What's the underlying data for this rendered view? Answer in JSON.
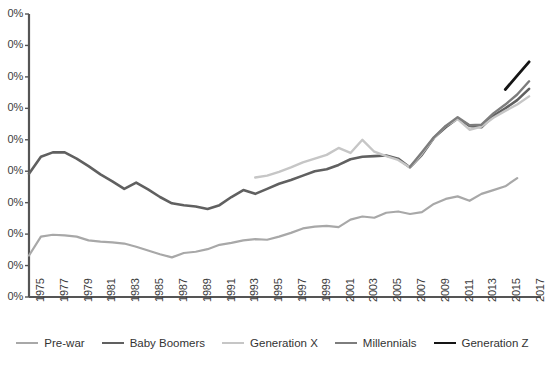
{
  "chart_data": {
    "type": "line",
    "title": "",
    "subtitle": "",
    "xlabel": "",
    "ylabel": "",
    "grid": false,
    "legend_position": "bottom",
    "xlim": [
      1975,
      2018
    ],
    "ylim": [
      0,
      45
    ],
    "yticks": [
      "0%",
      "0%",
      "0%",
      "0%",
      "0%",
      "0%",
      "0%",
      "0%",
      "0%",
      "0%"
    ],
    "ytick_values": [
      45,
      40,
      35,
      30,
      25,
      20,
      15,
      10,
      5,
      0
    ],
    "xticks": [
      "1975",
      "1977",
      "1979",
      "1981",
      "1983",
      "1985",
      "1987",
      "1989",
      "1991",
      "1993",
      "1995",
      "1997",
      "1999",
      "2001",
      "2003",
      "2005",
      "2007",
      "2009",
      "2011",
      "2013",
      "2015",
      "2017"
    ],
    "x": [
      1975,
      1976,
      1977,
      1978,
      1979,
      1980,
      1981,
      1982,
      1983,
      1984,
      1985,
      1986,
      1987,
      1988,
      1989,
      1990,
      1991,
      1992,
      1993,
      1994,
      1995,
      1996,
      1997,
      1998,
      1999,
      2000,
      2001,
      2002,
      2003,
      2004,
      2005,
      2006,
      2007,
      2008,
      2009,
      2010,
      2011,
      2012,
      2013,
      2014,
      2015,
      2016,
      2017,
      2018
    ],
    "series": [
      {
        "name": "Pre-war",
        "color": "#a8a8a8",
        "width": 2.2,
        "x": [
          1975,
          1976,
          1977,
          1978,
          1979,
          1980,
          1981,
          1982,
          1983,
          1984,
          1985,
          1986,
          1987,
          1988,
          1989,
          1990,
          1991,
          1992,
          1993,
          1994,
          1995,
          1996,
          1997,
          1998,
          1999,
          2000,
          2001,
          2002,
          2003,
          2004,
          2005,
          2006,
          2007,
          2008,
          2009,
          2010,
          2011,
          2012,
          2013,
          2014,
          2015,
          2016
        ],
        "values": [
          6.6,
          9.6,
          9.9,
          9.8,
          9.6,
          9.0,
          8.8,
          8.7,
          8.5,
          8.0,
          7.4,
          6.8,
          6.3,
          7.0,
          7.2,
          7.6,
          8.3,
          8.6,
          9.0,
          9.2,
          9.1,
          9.6,
          10.2,
          10.9,
          11.2,
          11.3,
          11.1,
          12.3,
          12.8,
          12.6,
          13.4,
          13.6,
          13.2,
          13.5,
          14.8,
          15.6,
          16.0,
          15.3,
          16.4,
          17.0,
          17.6,
          18.9
        ]
      },
      {
        "name": "Baby Boomers",
        "color": "#606060",
        "width": 2.6,
        "x": [
          1975,
          1976,
          1977,
          1978,
          1979,
          1980,
          1981,
          1982,
          1983,
          1984,
          1985,
          1986,
          1987,
          1988,
          1989,
          1990,
          1991,
          1992,
          1993,
          1994,
          1995,
          1996,
          1997,
          1998,
          1999,
          2000,
          2001,
          2002,
          2003,
          2004,
          2005,
          2006,
          2007,
          2008,
          2009,
          2010,
          2011,
          2012,
          2013,
          2014,
          2015,
          2016,
          2017
        ],
        "values": [
          19.6,
          22.3,
          23.0,
          23.0,
          22.0,
          20.8,
          19.5,
          18.4,
          17.2,
          18.2,
          17.1,
          15.9,
          14.9,
          14.6,
          14.4,
          14.0,
          14.6,
          15.9,
          17.0,
          16.4,
          17.2,
          18.0,
          18.6,
          19.3,
          20.0,
          20.3,
          21.0,
          21.9,
          22.3,
          22.4,
          22.5,
          22.0,
          20.6,
          22.6,
          25.3,
          27.0,
          28.4,
          27.2,
          27.0,
          28.8,
          30.0,
          31.3,
          33.1
        ]
      },
      {
        "name": "Generation X",
        "color": "#c6c6c6",
        "width": 2.4,
        "x": [
          1994,
          1995,
          1996,
          1997,
          1998,
          1999,
          2000,
          2001,
          2002,
          2003,
          2004,
          2005,
          2006,
          2007,
          2008,
          2009,
          2010,
          2011,
          2012,
          2013,
          2014,
          2015,
          2016,
          2017
        ],
        "values": [
          19.0,
          19.3,
          19.9,
          20.6,
          21.4,
          22.0,
          22.6,
          23.7,
          22.9,
          25.0,
          23.1,
          22.4,
          21.8,
          20.6,
          22.8,
          25.3,
          27.2,
          28.3,
          26.6,
          27.1,
          28.5,
          29.6,
          30.6,
          31.9
        ]
      },
      {
        "name": "Millennials",
        "color": "#7d7d7d",
        "width": 2.4,
        "x": [
          2007,
          2008,
          2009,
          2010,
          2011,
          2012,
          2013,
          2014,
          2015,
          2016,
          2017
        ],
        "values": [
          20.7,
          23.0,
          25.4,
          27.2,
          28.6,
          27.3,
          27.4,
          29.2,
          30.6,
          32.2,
          34.3
        ]
      },
      {
        "name": "Generation Z",
        "color": "#151515",
        "width": 2.8,
        "x": [
          2015,
          2016,
          2017
        ],
        "values": [
          33.0,
          35.2,
          37.4
        ]
      }
    ]
  }
}
